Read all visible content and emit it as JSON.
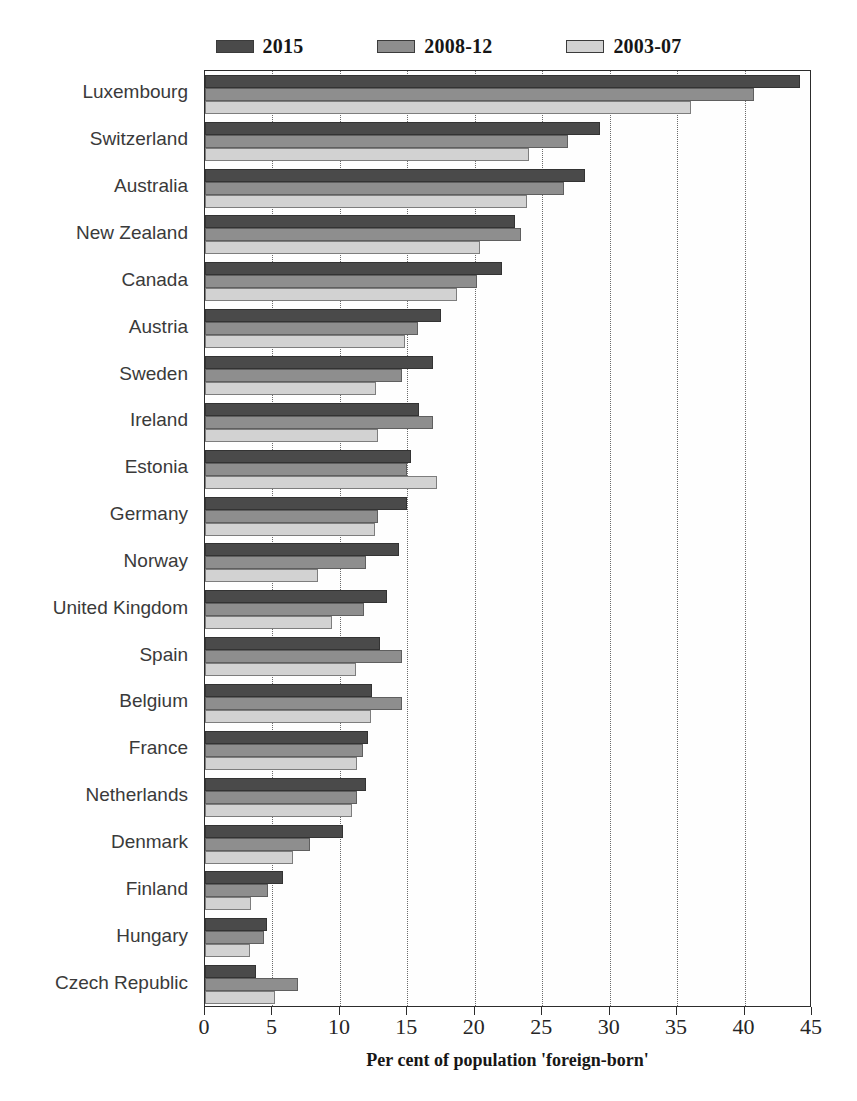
{
  "chart_data": {
    "type": "bar",
    "orientation": "horizontal",
    "title": "",
    "xlabel": "Per cent of population 'foreign-born'",
    "ylabel": "",
    "xlim": [
      0,
      45
    ],
    "xticks": [
      0,
      5,
      10,
      15,
      20,
      25,
      30,
      35,
      40,
      45
    ],
    "grid": "vertical-dotted",
    "legend_position": "top-center",
    "categories": [
      "Luxembourg",
      "Switzerland",
      "Australia",
      "New Zealand",
      "Canada",
      "Austria",
      "Sweden",
      "Ireland",
      "Estonia",
      "Germany",
      "Norway",
      "United Kingdom",
      "Spain",
      "Belgium",
      "France",
      "Netherlands",
      "Denmark",
      "Finland",
      "Hungary",
      "Czech Republic"
    ],
    "series": [
      {
        "name": "2015",
        "color": "#4a4a4a",
        "values": [
          44.1,
          29.3,
          28.2,
          23.0,
          22.0,
          17.5,
          16.9,
          15.9,
          15.3,
          15.0,
          14.4,
          13.5,
          13.0,
          12.4,
          12.1,
          11.9,
          10.2,
          5.8,
          4.6,
          3.8
        ]
      },
      {
        "name": "2008-12",
        "color": "#8e8e8e",
        "values": [
          40.7,
          26.9,
          26.6,
          23.4,
          20.2,
          15.8,
          14.6,
          16.9,
          15.0,
          12.8,
          11.9,
          11.8,
          14.6,
          14.6,
          11.7,
          11.3,
          7.8,
          4.7,
          4.4,
          6.9
        ]
      },
      {
        "name": "2003-07",
        "color": "#d2d2d2",
        "values": [
          36.0,
          24.0,
          23.9,
          20.4,
          18.7,
          14.8,
          12.7,
          12.8,
          17.2,
          12.6,
          8.4,
          9.4,
          11.2,
          12.3,
          11.3,
          10.9,
          6.5,
          3.4,
          3.3,
          5.2
        ]
      }
    ]
  },
  "legend": {
    "items": [
      {
        "label": "2015",
        "color": "#4a4a4a"
      },
      {
        "label": "2008-12",
        "color": "#8e8e8e"
      },
      {
        "label": "2003-07",
        "color": "#d2d2d2"
      }
    ]
  },
  "axis": {
    "x_title": "Per cent of population 'foreign-born'",
    "x_tick_labels": [
      "0",
      "5",
      "10",
      "15",
      "20",
      "25",
      "30",
      "35",
      "40",
      "45"
    ]
  }
}
